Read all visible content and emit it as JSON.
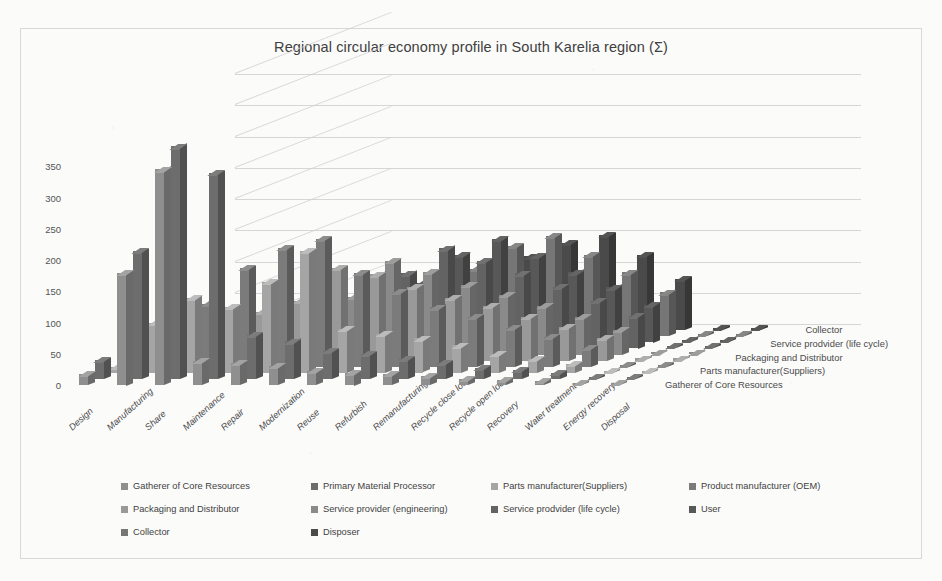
{
  "chart_data": {
    "type": "bar",
    "subtype": "3d-column",
    "title": "Regional circular economy profile in South Karelia region (Σ)",
    "xlabel": "",
    "ylabel": "",
    "ylim": [
      0,
      400
    ],
    "yticks": [
      0,
      50,
      100,
      150,
      200,
      250,
      300,
      350
    ],
    "grid": true,
    "legend_position": "bottom",
    "categories": [
      "Design",
      "Manufacturing",
      "Share",
      "Maintenance",
      "Repair",
      "Modernization",
      "Reuse",
      "Refurbish",
      "Remanufacturing",
      "Recycle close loop",
      "Recycle open loop",
      "Recovery",
      "Water treatment",
      "Energy recovery",
      "Disposal"
    ],
    "z_axis_labels": [
      "Gatherer of Core Resources",
      "Parts manufacturer(Suppliers)",
      "Packaging and Distributor",
      "Service prodvider (life cycle)",
      "Collector"
    ],
    "series": [
      {
        "name": "Gatherer of Core Resources",
        "color": "#8f8f8f",
        "values": [
          18,
          180,
          345,
          38,
          35,
          30,
          22,
          20,
          18,
          14,
          10,
          8,
          6,
          0,
          0
        ]
      },
      {
        "name": "Primary Material Processor",
        "color": "#6d6d6d",
        "values": [
          30,
          205,
          372,
          330,
          70,
          60,
          45,
          40,
          32,
          26,
          18,
          14,
          10,
          0,
          0
        ]
      },
      {
        "name": "Parts manufacturer(Suppliers)",
        "color": "#a5a5a5",
        "values": [
          10,
          80,
          120,
          105,
          145,
          195,
          70,
          62,
          55,
          44,
          30,
          22,
          14,
          0,
          0
        ]
      },
      {
        "name": "Product manufacturer (OEM)",
        "color": "#7b7b7b",
        "values": [
          8,
          128,
          100,
          158,
          190,
          205,
          150,
          120,
          95,
          80,
          62,
          48,
          30,
          0,
          0
        ]
      },
      {
        "name": "Packaging and Distributor",
        "color": "#999999",
        "values": [
          6,
          46,
          58,
          78,
          96,
          148,
          138,
          118,
          100,
          88,
          70,
          54,
          36,
          0,
          0
        ]
      },
      {
        "name": "Service provider (engineering)",
        "color": "#8a8a8a",
        "values": [
          5,
          34,
          44,
          60,
          74,
          92,
          150,
          132,
          112,
          96,
          78,
          60,
          40,
          0,
          0
        ]
      },
      {
        "name": "Service prodvider (life cycle)",
        "color": "#636363",
        "values": [
          4,
          28,
          36,
          50,
          62,
          78,
          120,
          160,
          140,
          120,
          98,
          76,
          52,
          0,
          0
        ]
      },
      {
        "name": "User",
        "color": "#585858",
        "values": [
          3,
          22,
          30,
          42,
          54,
          66,
          95,
          140,
          165,
          138,
          112,
          88,
          60,
          0,
          0
        ]
      },
      {
        "name": "Collector",
        "color": "#767676",
        "values": [
          2,
          18,
          26,
          36,
          46,
          58,
          76,
          108,
          145,
          160,
          130,
          102,
          70,
          0,
          0
        ]
      },
      {
        "name": "Disposer",
        "color": "#4a4a4a",
        "values": [
          2,
          14,
          22,
          30,
          40,
          50,
          64,
          88,
          118,
          140,
          152,
          120,
          82,
          0,
          0
        ]
      }
    ]
  },
  "legend": {
    "items": [
      {
        "label": "Gatherer of Core Resources",
        "color": "#8f8f8f"
      },
      {
        "label": "Primary Material Processor",
        "color": "#6d6d6d"
      },
      {
        "label": "Parts manufacturer(Suppliers)",
        "color": "#a5a5a5"
      },
      {
        "label": "Product manufacturer (OEM)",
        "color": "#7b7b7b"
      },
      {
        "label": "Packaging and Distributor",
        "color": "#999999"
      },
      {
        "label": "Service provider (engineering)",
        "color": "#8a8a8a"
      },
      {
        "label": "Service prodvider (life cycle)",
        "color": "#636363"
      },
      {
        "label": "User",
        "color": "#585858"
      },
      {
        "label": "Collector",
        "color": "#767676"
      },
      {
        "label": "Disposer",
        "color": "#4a4a4a"
      }
    ]
  },
  "colors": {
    "frame_border": "#d8d8d8",
    "gridline": "#cfcfcf",
    "title_text": "#404040",
    "axis_text": "#4a4a4a",
    "background": "#fbfbfa"
  }
}
